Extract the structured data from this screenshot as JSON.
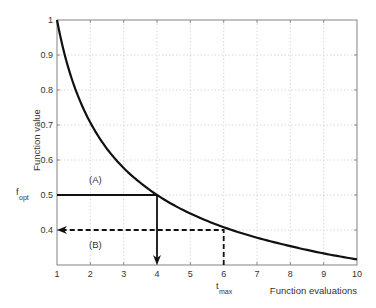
{
  "chart_data": {
    "type": "line",
    "title": "",
    "xlabel": "Function evaluations",
    "ylabel": "Function value",
    "xlim": [
      1,
      10
    ],
    "ylim": [
      0.3,
      1
    ],
    "grid": true,
    "x_ticks": [
      "1",
      "2",
      "3",
      "4",
      "5",
      "6",
      "7",
      "8",
      "9",
      "10"
    ],
    "y_ticks": [
      "0.4",
      "0.5",
      "0.6",
      "0.7",
      "0.8",
      "0.9",
      "1"
    ],
    "series": [
      {
        "name": "convergence curve",
        "x": [
          1,
          1.25,
          1.5,
          2,
          2.5,
          3,
          3.5,
          4,
          5,
          6,
          7,
          8,
          9,
          10
        ],
        "values": [
          1.0,
          0.894,
          0.816,
          0.707,
          0.632,
          0.577,
          0.535,
          0.5,
          0.447,
          0.408,
          0.378,
          0.354,
          0.333,
          0.316
        ]
      }
    ],
    "annotations": [
      {
        "id": "A",
        "label": "(A)",
        "type": "solid arrow",
        "path": "horizontal from (1, 0.5) to (4, 0.5), then down to x-axis at 4"
      },
      {
        "id": "B",
        "label": "(B)",
        "type": "dashed arrow",
        "path": "vertical from x-axis at 6 up to (6, 0.4), then left to y-axis at 0.4"
      },
      {
        "label": "f_opt",
        "position": "y-axis at 0.5"
      },
      {
        "label": "t_max",
        "position": "x-axis at 6"
      }
    ]
  },
  "labels": {
    "xlabel": "Function evaluations",
    "ylabel": "Function value",
    "annot_a": "(A)",
    "annot_b": "(B)",
    "fopt_main": "f",
    "fopt_sub": "opt",
    "tmax_main": "t",
    "tmax_sub": "max"
  },
  "ticks": {
    "x": [
      "1",
      "2",
      "3",
      "4",
      "5",
      "6",
      "7",
      "8",
      "9",
      "10"
    ],
    "y": [
      "0.4",
      "0.5",
      "0.6",
      "0.7",
      "0.8",
      "0.9",
      "1"
    ]
  }
}
